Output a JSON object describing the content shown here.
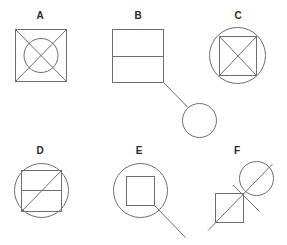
{
  "figures": [
    {
      "label": "A",
      "label_pos": [
        40,
        11
      ],
      "description": "Square with both diagonals and an inscribed circle centered at the intersection",
      "elements": {
        "square": {
          "x": 15,
          "y": 29,
          "w": 51,
          "h": 52
        },
        "circle": {
          "cx": 40.5,
          "cy": 55,
          "r": 17
        },
        "lines": [
          [
            15,
            29,
            66,
            81
          ],
          [
            66,
            29,
            15,
            81
          ]
        ]
      }
    },
    {
      "label": "B",
      "label_pos": [
        138,
        11
      ],
      "description": "Rectangle split by a horizontal midline, with a line from bottom-right corner to a small circle",
      "elements": {
        "square": {
          "x": 112,
          "y": 29,
          "w": 51,
          "h": 53
        },
        "lines": [
          [
            112,
            56,
            163,
            56
          ],
          [
            163,
            82,
            188,
            107
          ]
        ],
        "circle": {
          "cx": 199,
          "cy": 120,
          "r": 17
        }
      }
    },
    {
      "label": "C",
      "label_pos": [
        238,
        11
      ],
      "description": "Circle with inscribed square and both diagonals of the square",
      "elements": {
        "circle": {
          "cx": 237,
          "cy": 55,
          "r": 28
        },
        "square": {
          "x": 219,
          "y": 36,
          "w": 37,
          "h": 39
        },
        "lines": [
          [
            219,
            36,
            256,
            75
          ],
          [
            256,
            36,
            219,
            75
          ]
        ]
      }
    },
    {
      "label": "D",
      "label_pos": [
        40,
        146
      ],
      "description": "Circle with inscribed square, a horizontal midline, and one diagonal from bottom-left to top-right",
      "elements": {
        "circle": {
          "cx": 41,
          "cy": 190,
          "r": 27
        },
        "square": {
          "x": 21,
          "y": 170,
          "w": 40,
          "h": 41
        },
        "lines": [
          [
            21,
            190,
            61,
            190
          ],
          [
            21,
            211,
            61,
            170
          ]
        ]
      }
    },
    {
      "label": "E",
      "label_pos": [
        139,
        146
      ],
      "description": "Circle containing a smaller square, with a line extending from the square's bottom-right corner out past the circle",
      "elements": {
        "circle": {
          "cx": 140,
          "cy": 190,
          "r": 27
        },
        "square": {
          "x": 126,
          "y": 176,
          "w": 28,
          "h": 29
        },
        "lines": [
          [
            154,
            205,
            185,
            237
          ]
        ]
      }
    },
    {
      "label": "F",
      "label_pos": [
        237,
        146
      ],
      "description": "Square and circle joined corner-to-edge along a long diagonal line, crossed by a short perpendicular line at the junction",
      "elements": {
        "circle": {
          "cx": 256,
          "cy": 178,
          "r": 17
        },
        "square": {
          "x": 215,
          "y": 193,
          "w": 28,
          "h": 29
        },
        "lines": [
          [
            208,
            230,
            272,
            164
          ],
          [
            233,
            185,
            259,
            211
          ]
        ]
      }
    }
  ],
  "style": {
    "stroke_color": "#6e6e6e",
    "label_color": "#2a2a2a",
    "background": "#ffffff"
  }
}
